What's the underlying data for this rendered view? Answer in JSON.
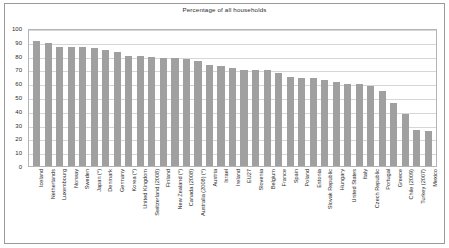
{
  "chart_data": {
    "type": "bar",
    "title": "Percentage of all households",
    "xlabel": "",
    "ylabel": "",
    "ylim": [
      0,
      100
    ],
    "yticks": [
      100,
      90,
      80,
      70,
      60,
      50,
      40,
      30,
      20,
      10,
      0
    ],
    "grid": true,
    "legend": null,
    "bar_color": "#a0a0a0",
    "categories": [
      "Iceland",
      "Netherlands",
      "Luxembourg",
      "Norway",
      "Sweden",
      "Japan (*)",
      "Denmark",
      "Germany",
      "Korea (*)",
      "United Kingdom",
      "Switzerland (2008)",
      "Finland",
      "New Zealand (*)",
      "Canada (2008)",
      "Australia (2008) (*)",
      "Austria",
      "Israel",
      "Ireland",
      "EU27",
      "Slovenia",
      "Belgium",
      "France",
      "Spain",
      "Poland",
      "Estonia",
      "Slovak Republic",
      "Hungary",
      "United States",
      "Italy",
      "Czech Republic",
      "Portugal",
      "Greece",
      "Chile (2009)",
      "Turkey (2007)",
      "Mexico"
    ],
    "values": [
      92,
      90.5,
      87.5,
      87.5,
      87.5,
      86.5,
      85.5,
      83.5,
      81,
      81,
      80,
      79.5,
      79.5,
      79,
      77.5,
      74,
      73.5,
      72,
      70.5,
      70.5,
      70.5,
      68.5,
      65.5,
      65,
      64.5,
      63,
      62,
      60.5,
      60,
      58.5,
      55,
      46,
      38.5,
      26.5,
      25.5
    ]
  }
}
